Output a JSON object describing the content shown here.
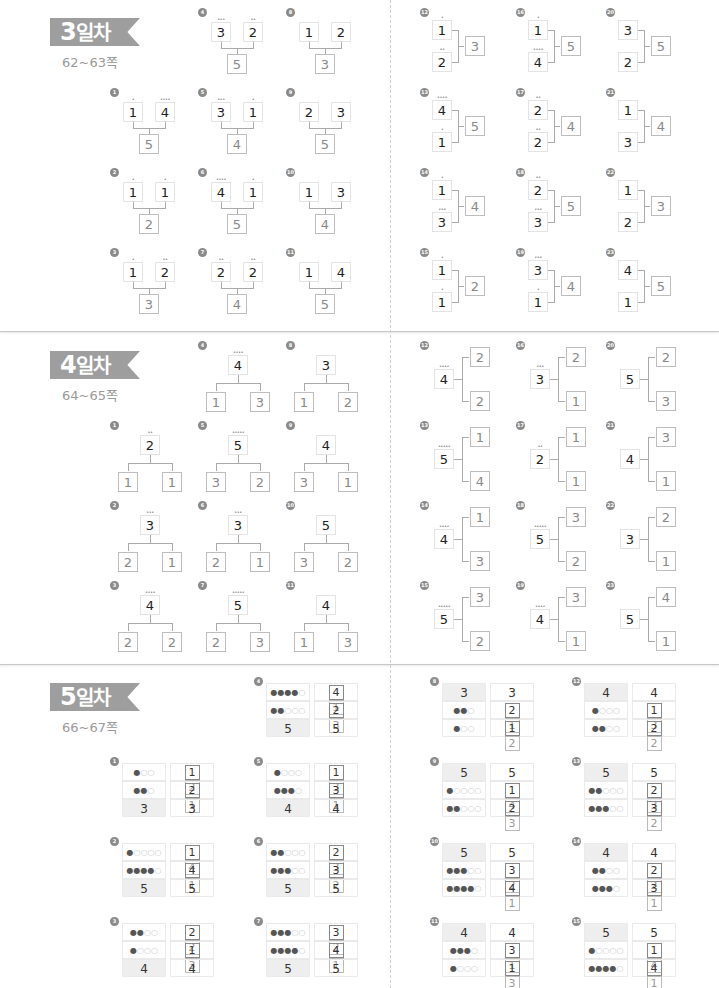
{
  "sections": [
    {
      "title_num": "3",
      "title_text": "일차",
      "pages": "62~63쪽",
      "type": "combine",
      "problems": [
        {
          "n": "1",
          "a": "1",
          "b": "4",
          "sum": "5"
        },
        {
          "n": "2",
          "a": "1",
          "b": "1",
          "sum": "2"
        },
        {
          "n": "3",
          "a": "1",
          "b": "2",
          "sum": "3"
        },
        {
          "n": "4",
          "a": "3",
          "b": "2",
          "sum": "5"
        },
        {
          "n": "5",
          "a": "3",
          "b": "1",
          "sum": "4"
        },
        {
          "n": "6",
          "a": "4",
          "b": "1",
          "sum": "5"
        },
        {
          "n": "7",
          "a": "2",
          "b": "2",
          "sum": "4"
        },
        {
          "n": "8",
          "a": "1",
          "b": "2",
          "sum": "3"
        },
        {
          "n": "9",
          "a": "2",
          "b": "3",
          "sum": "5"
        },
        {
          "n": "10",
          "a": "1",
          "b": "3",
          "sum": "4"
        },
        {
          "n": "11",
          "a": "1",
          "b": "4",
          "sum": "5"
        },
        {
          "n": "12",
          "a": "1",
          "b": "2",
          "sum": "3"
        },
        {
          "n": "13",
          "a": "4",
          "b": "1",
          "sum": "5"
        },
        {
          "n": "14",
          "a": "1",
          "b": "3",
          "sum": "4"
        },
        {
          "n": "15",
          "a": "1",
          "b": "1",
          "sum": "2"
        },
        {
          "n": "16",
          "a": "1",
          "b": "4",
          "sum": "5"
        },
        {
          "n": "17",
          "a": "2",
          "b": "2",
          "sum": "4"
        },
        {
          "n": "18",
          "a": "2",
          "b": "3",
          "sum": "5"
        },
        {
          "n": "19",
          "a": "3",
          "b": "1",
          "sum": "4"
        },
        {
          "n": "20",
          "a": "3",
          "b": "2",
          "sum": "5"
        },
        {
          "n": "21",
          "a": "1",
          "b": "3",
          "sum": "4"
        },
        {
          "n": "22",
          "a": "1",
          "b": "2",
          "sum": "3"
        },
        {
          "n": "23",
          "a": "4",
          "b": "1",
          "sum": "5"
        }
      ]
    },
    {
      "title_num": "4",
      "title_text": "일차",
      "pages": "64~65쪽",
      "type": "split",
      "problems": [
        {
          "n": "1",
          "whole": "2",
          "a": "1",
          "b": "1"
        },
        {
          "n": "2",
          "whole": "3",
          "a": "2",
          "b": "1"
        },
        {
          "n": "3",
          "whole": "4",
          "a": "2",
          "b": "2"
        },
        {
          "n": "4",
          "whole": "4",
          "a": "1",
          "b": "3"
        },
        {
          "n": "5",
          "whole": "5",
          "a": "3",
          "b": "2"
        },
        {
          "n": "6",
          "whole": "3",
          "a": "2",
          "b": "1"
        },
        {
          "n": "7",
          "whole": "5",
          "a": "2",
          "b": "3"
        },
        {
          "n": "8",
          "whole": "3",
          "a": "1",
          "b": "2"
        },
        {
          "n": "9",
          "whole": "4",
          "a": "3",
          "b": "1"
        },
        {
          "n": "10",
          "whole": "5",
          "a": "3",
          "b": "2"
        },
        {
          "n": "11",
          "whole": "4",
          "a": "1",
          "b": "3"
        },
        {
          "n": "12",
          "whole": "4",
          "a": "2",
          "b": "2"
        },
        {
          "n": "13",
          "whole": "5",
          "a": "1",
          "b": "4"
        },
        {
          "n": "14",
          "whole": "4",
          "a": "1",
          "b": "3"
        },
        {
          "n": "15",
          "whole": "5",
          "a": "3",
          "b": "2"
        },
        {
          "n": "16",
          "whole": "3",
          "a": "2",
          "b": "1"
        },
        {
          "n": "17",
          "whole": "2",
          "a": "1",
          "b": "1"
        },
        {
          "n": "18",
          "whole": "5",
          "a": "3",
          "b": "2"
        },
        {
          "n": "19",
          "whole": "4",
          "a": "3",
          "b": "1"
        },
        {
          "n": "20",
          "whole": "5",
          "a": "2",
          "b": "3"
        },
        {
          "n": "21",
          "whole": "4",
          "a": "3",
          "b": "1"
        },
        {
          "n": "22",
          "whole": "3",
          "a": "2",
          "b": "1"
        },
        {
          "n": "23",
          "whole": "5",
          "a": "4",
          "b": "1"
        }
      ]
    },
    {
      "title_num": "5",
      "title_text": "일차",
      "pages": "66~67쪽",
      "type": "table",
      "problems": [
        {
          "n": "1",
          "total": "3",
          "r1": {
            "fill": 1,
            "of": 3,
            "x": "1",
            "y": "2"
          },
          "r2": {
            "fill": 2,
            "of": 3,
            "x": "2",
            "y": "1"
          }
        },
        {
          "n": "2",
          "total": "5",
          "r1": {
            "fill": 1,
            "of": 5,
            "x": "1",
            "y": "4"
          },
          "r2": {
            "fill": 4,
            "of": 5,
            "x": "4",
            "y": "1"
          }
        },
        {
          "n": "3",
          "total": "4",
          "r1": {
            "fill": 2,
            "of": 4,
            "x": "2",
            "y": "2"
          },
          "r2": {
            "fill": 1,
            "of": 4,
            "x": "1",
            "y": "3"
          }
        },
        {
          "n": "4",
          "total": "5",
          "r1": {
            "fill": 4,
            "of": 5,
            "x": "4",
            "y": "1"
          },
          "r2": {
            "fill": 2,
            "of": 5,
            "x": "2",
            "y": "3"
          }
        },
        {
          "n": "5",
          "total": "4",
          "r1": {
            "fill": 1,
            "of": 4,
            "x": "1",
            "y": "3"
          },
          "r2": {
            "fill": 3,
            "of": 4,
            "x": "3",
            "y": "1"
          }
        },
        {
          "n": "6",
          "total": "5",
          "r1": {
            "fill": 2,
            "of": 5,
            "x": "2",
            "y": "3"
          },
          "r2": {
            "fill": 3,
            "of": 5,
            "x": "3",
            "y": "2"
          }
        },
        {
          "n": "7",
          "total": "5",
          "r1": {
            "fill": 3,
            "of": 5,
            "x": "3",
            "y": "2"
          },
          "r2": {
            "fill": 4,
            "of": 5,
            "x": "4",
            "y": "1"
          }
        },
        {
          "n": "8",
          "total": "3",
          "r1": {
            "fill": 2,
            "of": 3,
            "x": "2",
            "y": "1"
          },
          "r2": {
            "fill": 1,
            "of": 3,
            "x": "1",
            "y": "2"
          }
        },
        {
          "n": "9",
          "total": "5",
          "r1": {
            "fill": 1,
            "of": 5,
            "x": "1",
            "y": "4"
          },
          "r2": {
            "fill": 2,
            "of": 5,
            "x": "2",
            "y": "3"
          }
        },
        {
          "n": "10",
          "total": "5",
          "r1": {
            "fill": 3,
            "of": 5,
            "x": "3",
            "y": "2"
          },
          "r2": {
            "fill": 4,
            "of": 5,
            "x": "4",
            "y": "1"
          }
        },
        {
          "n": "11",
          "total": "4",
          "r1": {
            "fill": 3,
            "of": 4,
            "x": "3",
            "y": "1"
          },
          "r2": {
            "fill": 1,
            "of": 4,
            "x": "1",
            "y": "3"
          }
        },
        {
          "n": "12",
          "total": "4",
          "r1": {
            "fill": 1,
            "of": 4,
            "x": "1",
            "y": "3"
          },
          "r2": {
            "fill": 2,
            "of": 4,
            "x": "2",
            "y": "2"
          }
        },
        {
          "n": "13",
          "total": "5",
          "r1": {
            "fill": 2,
            "of": 5,
            "x": "2",
            "y": "3"
          },
          "r2": {
            "fill": 3,
            "of": 5,
            "x": "3",
            "y": "2"
          }
        },
        {
          "n": "14",
          "total": "4",
          "r1": {
            "fill": 2,
            "of": 4,
            "x": "2",
            "y": "2"
          },
          "r2": {
            "fill": 3,
            "of": 4,
            "x": "3",
            "y": "1"
          }
        },
        {
          "n": "15",
          "total": "5",
          "r1": {
            "fill": 1,
            "of": 5,
            "x": "1",
            "y": "4"
          },
          "r2": {
            "fill": 4,
            "of": 5,
            "x": "4",
            "y": "1"
          }
        }
      ]
    }
  ],
  "colors": {
    "ribbon": "#9e9e9e",
    "badge": "#8a8a8a",
    "separator": "#c8c8c8"
  }
}
